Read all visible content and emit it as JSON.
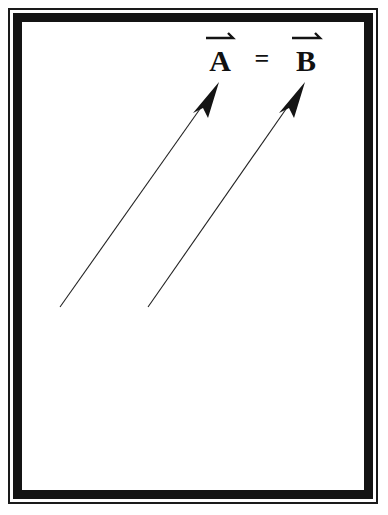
{
  "equation": {
    "left": "A",
    "operator": "=",
    "right": "B"
  },
  "vectors": [
    {
      "name": "A",
      "x1": 60,
      "y1": 307,
      "x2": 219,
      "y2": 82
    },
    {
      "name": "B",
      "x1": 148,
      "y1": 307,
      "x2": 305,
      "y2": 82
    }
  ],
  "colors": {
    "ink": "#141414",
    "background": "#ffffff"
  }
}
